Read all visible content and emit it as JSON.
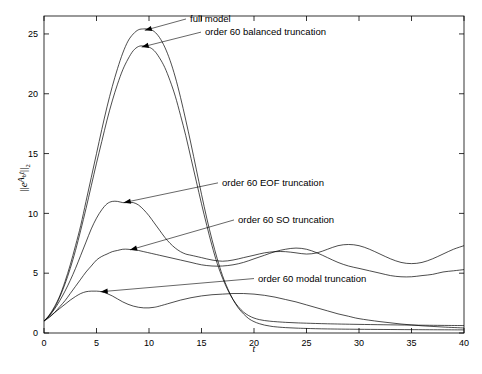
{
  "figure": {
    "type": "line-plot",
    "background": "#ffffff",
    "line_color": "#000000"
  },
  "chart_data": {
    "type": "line",
    "title": "",
    "xlabel": "t",
    "ylabel": "||e^{A_b t}||_2",
    "ylabel_parts": {
      "norm_open": "||",
      "base": "e",
      "exp_matrix": "A",
      "exp_sub": "b",
      "exp_var": "t",
      "norm_close": "||",
      "norm_sub": "2"
    },
    "xlim": [
      0,
      40
    ],
    "ylim": [
      0,
      26.5
    ],
    "xticks": [
      0,
      5,
      10,
      15,
      20,
      25,
      30,
      35,
      40
    ],
    "yticks": [
      0,
      5,
      10,
      15,
      20,
      25
    ],
    "xtick_labels": [
      "0",
      "5",
      "10",
      "15",
      "20",
      "25",
      "30",
      "35",
      "40"
    ],
    "ytick_labels": [
      "0",
      "5",
      "10",
      "15",
      "20",
      "25"
    ],
    "grid": false,
    "legend": "none (inline leader-line annotations)",
    "series": [
      {
        "name": "full model",
        "peak_value": 25.4,
        "peak_t": 10.0,
        "x": [
          0,
          0.5,
          1,
          1.5,
          2,
          2.5,
          3,
          3.5,
          4,
          4.5,
          5,
          5.5,
          6,
          6.5,
          7,
          7.5,
          8,
          8.5,
          9,
          9.5,
          10,
          10.5,
          11,
          11.5,
          12,
          12.5,
          13,
          13.5,
          14,
          14.5,
          15,
          15.5,
          16,
          16.5,
          17,
          17.5,
          18,
          18.5,
          19,
          19.5,
          20,
          20.5,
          21,
          21.5,
          22,
          23,
          24,
          25,
          27,
          30,
          35,
          40
        ],
        "y": [
          1.0,
          1.5,
          2.2,
          3.1,
          4.3,
          5.7,
          7.3,
          9.0,
          11.0,
          13.0,
          15.0,
          17.0,
          18.9,
          20.6,
          22.1,
          23.4,
          24.4,
          25.0,
          25.35,
          25.42,
          25.4,
          25.2,
          24.7,
          23.9,
          22.8,
          21.4,
          19.7,
          17.8,
          15.8,
          13.7,
          11.6,
          9.6,
          7.8,
          6.2,
          4.8,
          3.7,
          2.8,
          2.1,
          1.6,
          1.2,
          0.95,
          0.78,
          0.66,
          0.58,
          0.52,
          0.45,
          0.41,
          0.38,
          0.34,
          0.31,
          0.28,
          0.26
        ]
      },
      {
        "name": "order 60 balanced truncation",
        "peak_value": 24.0,
        "peak_t": 9.6,
        "x": [
          0,
          0.5,
          1,
          1.5,
          2,
          2.5,
          3,
          3.5,
          4,
          4.5,
          5,
          5.5,
          6,
          6.5,
          7,
          7.5,
          8,
          8.5,
          9,
          9.5,
          10,
          10.5,
          11,
          11.5,
          12,
          12.5,
          13,
          13.5,
          14,
          14.5,
          15,
          15.5,
          16,
          16.5,
          17,
          17.5,
          18,
          18.5,
          19,
          19.5,
          20,
          20.5,
          21,
          21.5,
          22,
          23,
          24,
          25,
          27,
          30,
          35,
          40
        ],
        "y": [
          1.0,
          1.45,
          2.1,
          3.0,
          4.1,
          5.4,
          6.9,
          8.6,
          10.4,
          12.3,
          14.2,
          16.0,
          17.8,
          19.4,
          20.8,
          22.0,
          22.9,
          23.6,
          23.95,
          24.0,
          23.9,
          23.6,
          23.0,
          22.2,
          21.1,
          19.8,
          18.2,
          16.5,
          14.6,
          12.7,
          10.8,
          9.0,
          7.3,
          5.8,
          4.6,
          3.6,
          2.8,
          2.2,
          1.75,
          1.45,
          1.25,
          1.12,
          1.04,
          0.99,
          0.95,
          0.89,
          0.85,
          0.82,
          0.77,
          0.72,
          0.66,
          0.62
        ]
      },
      {
        "name": "order 60 EOF truncation",
        "peak_value": 11.0,
        "peak_t": 8.0,
        "x": [
          0,
          0.5,
          1,
          1.5,
          2,
          2.5,
          3,
          3.5,
          4,
          4.5,
          5,
          5.5,
          6,
          6.5,
          7,
          7.5,
          8,
          8.5,
          9,
          9.5,
          10,
          10.5,
          11,
          11.5,
          12,
          12.5,
          13,
          13.5,
          14,
          15,
          16,
          17,
          18,
          19,
          20,
          21,
          22,
          23,
          24,
          25,
          26,
          27,
          28,
          29,
          30,
          31,
          32,
          33,
          34,
          35,
          36,
          37,
          38,
          39,
          40
        ],
        "y": [
          1.0,
          1.45,
          2.0,
          2.7,
          3.5,
          4.4,
          5.4,
          6.5,
          7.6,
          8.7,
          9.6,
          10.3,
          10.8,
          11.0,
          11.0,
          10.9,
          10.9,
          10.9,
          10.7,
          10.3,
          9.8,
          9.2,
          8.6,
          8.0,
          7.5,
          7.1,
          6.8,
          6.6,
          6.5,
          6.3,
          6.1,
          6.0,
          6.1,
          6.3,
          6.5,
          6.7,
          6.8,
          6.8,
          6.7,
          6.6,
          6.7,
          7.0,
          7.3,
          7.4,
          7.3,
          7.0,
          6.6,
          6.2,
          5.9,
          5.8,
          5.9,
          6.2,
          6.6,
          7.0,
          7.3
        ]
      },
      {
        "name": "order 60 SO truncation",
        "peak_value": 7.0,
        "peak_t": 9.0,
        "x": [
          0,
          0.5,
          1,
          1.5,
          2,
          2.5,
          3,
          3.5,
          4,
          4.5,
          5,
          5.5,
          6,
          6.5,
          7,
          7.5,
          8,
          8.5,
          9,
          9.5,
          10,
          11,
          12,
          13,
          14,
          15,
          16,
          17,
          18,
          19,
          20,
          21,
          22,
          23,
          24,
          25,
          26,
          27,
          28,
          29,
          30,
          31,
          32,
          33,
          34,
          35,
          36,
          37,
          38,
          39,
          40
        ],
        "y": [
          1.0,
          1.3,
          1.7,
          2.2,
          2.7,
          3.3,
          3.9,
          4.5,
          5.1,
          5.6,
          6.1,
          6.4,
          6.6,
          6.8,
          6.9,
          7.0,
          7.0,
          6.95,
          6.9,
          6.8,
          6.7,
          6.5,
          6.3,
          6.1,
          5.9,
          5.7,
          5.6,
          5.6,
          5.7,
          5.9,
          6.2,
          6.5,
          6.8,
          7.0,
          7.1,
          7.0,
          6.7,
          6.3,
          5.9,
          5.6,
          5.4,
          5.2,
          5.0,
          4.8,
          4.7,
          4.7,
          4.8,
          4.9,
          5.1,
          5.2,
          5.3
        ]
      },
      {
        "name": "order 60 modal  truncation",
        "peak_value": 3.5,
        "peak_t": 5.0,
        "x": [
          0,
          0.5,
          1,
          1.5,
          2,
          2.5,
          3,
          3.5,
          4,
          4.5,
          5,
          5.5,
          6,
          6.5,
          7,
          7.5,
          8,
          8.5,
          9,
          9.5,
          10,
          10.5,
          11,
          12,
          13,
          14,
          15,
          16,
          17,
          18,
          19,
          20,
          21,
          22,
          23,
          24,
          25,
          26,
          27,
          28,
          29,
          30,
          32,
          34,
          36,
          38,
          40
        ],
        "y": [
          1.0,
          1.35,
          1.7,
          2.05,
          2.4,
          2.75,
          3.05,
          3.3,
          3.45,
          3.5,
          3.5,
          3.45,
          3.3,
          3.1,
          2.85,
          2.6,
          2.4,
          2.25,
          2.15,
          2.1,
          2.1,
          2.15,
          2.25,
          2.5,
          2.75,
          2.95,
          3.1,
          3.2,
          3.25,
          3.3,
          3.3,
          3.25,
          3.15,
          3.0,
          2.8,
          2.6,
          2.35,
          2.1,
          1.85,
          1.6,
          1.4,
          1.2,
          0.95,
          0.75,
          0.6,
          0.5,
          0.42
        ]
      }
    ],
    "annotations": [
      {
        "text": "full model",
        "label_x": 190,
        "label_y": 26.0,
        "points_to_t": 9.6,
        "points_to_y": 25.3
      },
      {
        "text": "order 60 balanced truncation",
        "label_x": 205,
        "label_y": 24.9,
        "points_to_t": 9.3,
        "points_to_y": 23.9
      },
      {
        "text": "order 60 EOF truncation",
        "label_x": 222,
        "label_y": 12.3,
        "points_to_t": 7.6,
        "points_to_y": 10.9
      },
      {
        "text": "order 60 SO truncation",
        "label_x": 238,
        "label_y": 9.2,
        "points_to_t": 8.2,
        "points_to_y": 6.95
      },
      {
        "text": "order 60 modal  truncation",
        "label_x": 258,
        "label_y": 4.3,
        "points_to_t": 5.4,
        "points_to_y": 3.45
      }
    ]
  }
}
